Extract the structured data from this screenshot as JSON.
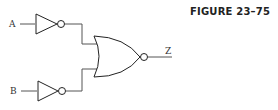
{
  "figure": {
    "label": "FIGURE 23–75"
  },
  "circuit": {
    "inputs": [
      {
        "name": "A"
      },
      {
        "name": "B"
      }
    ],
    "output": {
      "name": "Z"
    },
    "gates": [
      {
        "type": "NOT",
        "input": "A"
      },
      {
        "type": "NOT",
        "input": "B"
      },
      {
        "type": "NOR",
        "inputs": [
          "NOT A",
          "NOT B"
        ],
        "output": "Z"
      }
    ]
  },
  "colors": {
    "wire": "#555555",
    "gate_outline": "#222222",
    "background": "#ffffff"
  }
}
